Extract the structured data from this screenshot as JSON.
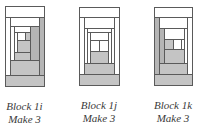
{
  "blocks": [
    {
      "id": "1i",
      "title": "Block 1i",
      "instruction": "Make 3",
      "origin": [
        5,
        6
      ],
      "size": [
        39,
        80
      ],
      "caption_pos": [
        -5,
        100
      ],
      "pieces": [
        {
          "x": 0,
          "y": 0,
          "w": 39,
          "h": 11,
          "c": "w"
        },
        {
          "x": 0,
          "y": 69,
          "w": 39,
          "h": 11,
          "c": "g"
        },
        {
          "x": 0,
          "y": 11,
          "w": 5,
          "h": 58,
          "c": "w"
        },
        {
          "x": 34,
          "y": 11,
          "w": 5,
          "h": 58,
          "c": "d"
        },
        {
          "x": 5,
          "y": 11,
          "w": 29,
          "h": 9,
          "c": "w"
        },
        {
          "x": 5,
          "y": 54,
          "w": 29,
          "h": 15,
          "c": "g"
        },
        {
          "x": 5,
          "y": 20,
          "w": 4,
          "h": 34,
          "c": "w"
        },
        {
          "x": 25,
          "y": 20,
          "w": 9,
          "h": 34,
          "c": "d"
        },
        {
          "x": 9,
          "y": 20,
          "w": 16,
          "h": 6,
          "c": "w"
        },
        {
          "x": 9,
          "y": 46,
          "w": 16,
          "h": 8,
          "c": "g"
        },
        {
          "x": 9,
          "y": 26,
          "w": 3,
          "h": 20,
          "c": "w"
        },
        {
          "x": 12,
          "y": 26,
          "w": 8,
          "h": 8,
          "c": "w"
        },
        {
          "x": 20,
          "y": 26,
          "w": 5,
          "h": 8,
          "c": "g"
        },
        {
          "x": 12,
          "y": 34,
          "w": 13,
          "h": 12,
          "c": "g"
        }
      ]
    },
    {
      "id": "1j",
      "title": "Block 1j",
      "instruction": "Make 3",
      "origin": [
        79,
        7
      ],
      "size": [
        40,
        78
      ],
      "caption_pos": [
        -10,
        99
      ],
      "pieces": [
        {
          "x": 0,
          "y": 0,
          "w": 40,
          "h": 10,
          "c": "w"
        },
        {
          "x": 0,
          "y": 67,
          "w": 40,
          "h": 11,
          "c": "g"
        },
        {
          "x": 0,
          "y": 10,
          "w": 5,
          "h": 57,
          "c": "w"
        },
        {
          "x": 35,
          "y": 10,
          "w": 5,
          "h": 57,
          "c": "w"
        },
        {
          "x": 5,
          "y": 10,
          "w": 30,
          "h": 11,
          "c": "w"
        },
        {
          "x": 5,
          "y": 56,
          "w": 30,
          "h": 11,
          "c": "g"
        },
        {
          "x": 5,
          "y": 21,
          "w": 3,
          "h": 35,
          "c": "w"
        },
        {
          "x": 32,
          "y": 21,
          "w": 3,
          "h": 35,
          "c": "w"
        },
        {
          "x": 8,
          "y": 21,
          "w": 24,
          "h": 4,
          "c": "w"
        },
        {
          "x": 8,
          "y": 25,
          "w": 3,
          "h": 31,
          "c": "w"
        },
        {
          "x": 29,
          "y": 25,
          "w": 3,
          "h": 31,
          "c": "w"
        },
        {
          "x": 11,
          "y": 25,
          "w": 18,
          "h": 8,
          "c": "w"
        },
        {
          "x": 11,
          "y": 33,
          "w": 9,
          "h": 11,
          "c": "w"
        },
        {
          "x": 20,
          "y": 33,
          "w": 9,
          "h": 11,
          "c": "w"
        },
        {
          "x": 11,
          "y": 44,
          "w": 18,
          "h": 12,
          "c": "g"
        }
      ]
    },
    {
      "id": "1k",
      "title": "Block 1k",
      "instruction": "Make 3",
      "origin": [
        154,
        7
      ],
      "size": [
        38,
        78
      ],
      "caption_pos": [
        -11,
        99
      ],
      "pieces": [
        {
          "x": 0,
          "y": 0,
          "w": 38,
          "h": 10,
          "c": "w"
        },
        {
          "x": 0,
          "y": 67,
          "w": 38,
          "h": 11,
          "c": "g"
        },
        {
          "x": 0,
          "y": 10,
          "w": 5,
          "h": 57,
          "c": "d"
        },
        {
          "x": 33,
          "y": 10,
          "w": 5,
          "h": 57,
          "c": "w"
        },
        {
          "x": 5,
          "y": 10,
          "w": 28,
          "h": 11,
          "c": "w"
        },
        {
          "x": 5,
          "y": 56,
          "w": 28,
          "h": 11,
          "c": "g"
        },
        {
          "x": 5,
          "y": 21,
          "w": 5,
          "h": 35,
          "c": "d"
        },
        {
          "x": 30,
          "y": 21,
          "w": 3,
          "h": 35,
          "c": "w"
        },
        {
          "x": 10,
          "y": 21,
          "w": 20,
          "h": 11,
          "c": "w"
        },
        {
          "x": 10,
          "y": 42,
          "w": 20,
          "h": 14,
          "c": "g"
        },
        {
          "x": 10,
          "y": 32,
          "w": 9,
          "h": 10,
          "c": "g"
        },
        {
          "x": 19,
          "y": 32,
          "w": 8,
          "h": 10,
          "c": "w"
        },
        {
          "x": 27,
          "y": 32,
          "w": 3,
          "h": 10,
          "c": "w"
        }
      ]
    }
  ]
}
